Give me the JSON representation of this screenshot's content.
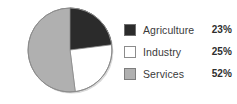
{
  "background_color": "#ffffff",
  "chart_data": {
    "type": "pie",
    "title": "",
    "categories": [
      "Agriculture",
      "Industry",
      "Services"
    ],
    "values": [
      23,
      25,
      52
    ],
    "value_labels": [
      "23%",
      "25%",
      "52%"
    ],
    "unit": "%",
    "start_angle_deg": 0,
    "direction": "clockwise",
    "colors": [
      "#2b2b2b",
      "#ffffff",
      "#b0b0b0"
    ],
    "slice_border_color": "#8c8c8c",
    "legend_position": "right",
    "grid": false
  },
  "pie": {
    "center_x": 44,
    "center_y": 44,
    "radius": 42,
    "outline_color": "#8c8c8c",
    "shadow_color": "#d9d9d9",
    "slices": [
      {
        "name": "Agriculture",
        "value": 23,
        "color": "#2b2b2b",
        "border": "#2b2b2b"
      },
      {
        "name": "Industry",
        "value": 25,
        "color": "#ffffff",
        "border": "#8c8c8c"
      },
      {
        "name": "Services",
        "value": 52,
        "color": "#b0b0b0",
        "border": "#8c8c8c"
      }
    ]
  },
  "legend": {
    "items": [
      {
        "label": "Agriculture",
        "value": "23%",
        "swatch_fill": "#2b2b2b",
        "swatch_border": "#6e6e6e",
        "swatch_name": "swatch-agriculture"
      },
      {
        "label": "Industry",
        "value": "25%",
        "swatch_fill": "#ffffff",
        "swatch_border": "#8c8c8c",
        "swatch_name": "swatch-industry"
      },
      {
        "label": "Services",
        "value": "52%",
        "swatch_fill": "#b0b0b0",
        "swatch_border": "#7d7d7d",
        "swatch_name": "swatch-services"
      }
    ]
  }
}
